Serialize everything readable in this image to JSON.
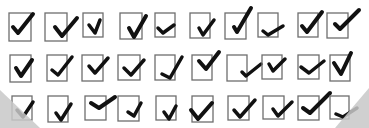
{
  "scene": {
    "description": "Grid of hand-drawn check marks in square boxes",
    "background": "#ffffff",
    "box_color": "#6e6e6e",
    "check_color": "#111111",
    "shadow_color": "#c8c8c8"
  },
  "rows": [
    {
      "y": 13,
      "items": [
        {
          "x": 9,
          "w": 22,
          "h": 28,
          "check": "M13 27 L18 33 L33 14",
          "sw": 4
        },
        {
          "x": 45,
          "w": 22,
          "h": 28,
          "check": "M55 27 L62 36 L77 18",
          "sw": 4
        },
        {
          "x": 83,
          "w": 20,
          "h": 24,
          "check": "M89 25 L95 33 L100 20",
          "sw": 3.5
        },
        {
          "x": 120,
          "w": 22,
          "h": 26,
          "check": "M129 28 L134 37 L146 16",
          "sw": 4
        },
        {
          "x": 155,
          "w": 20,
          "h": 24,
          "check": "M158 28 L163 33 L174 25",
          "sw": 3.5
        },
        {
          "x": 190,
          "w": 20,
          "h": 25,
          "check": "M199 28 L203 35 L214 20",
          "sw": 3.5
        },
        {
          "x": 225,
          "w": 21,
          "h": 26,
          "check": "M234 27 L237 32 L251 8",
          "sw": 4
        },
        {
          "x": 258,
          "w": 20,
          "h": 24,
          "check": "M263 31 L268 35 L283 26",
          "sw": 3.5
        },
        {
          "x": 298,
          "w": 20,
          "h": 24,
          "check": "M302 26 L307 32 L322 12",
          "sw": 4
        },
        {
          "x": 327,
          "w": 21,
          "h": 25,
          "check": "M335 24 L340 29 L359 10",
          "sw": 4
        }
      ]
    },
    {
      "y": 55,
      "items": [
        {
          "x": 10,
          "w": 21,
          "h": 27,
          "check": "M16 68 L21 76 L32 60",
          "sw": 4
        },
        {
          "x": 47,
          "w": 20,
          "h": 26,
          "check": "M52 70 L58 75 L72 57",
          "sw": 3.5
        },
        {
          "x": 82,
          "w": 21,
          "h": 26,
          "check": "M89 66 L95 73 L108 58",
          "sw": 3.5
        },
        {
          "x": 118,
          "w": 22,
          "h": 25,
          "check": "M124 68 L131 75 L144 60",
          "sw": 3.5
        },
        {
          "x": 155,
          "w": 20,
          "h": 25,
          "check": "M162 74 L170 78 L182 57",
          "sw": 3.5
        },
        {
          "x": 192,
          "w": 20,
          "h": 25,
          "check": "M199 61 L206 69 L219 52",
          "sw": 4
        },
        {
          "x": 227,
          "w": 20,
          "h": 26,
          "check": "M242 72 L246 76 L261 64",
          "sw": 3.5
        },
        {
          "x": 262,
          "w": 20,
          "h": 24,
          "check": "M269 64 L273 71 L285 59",
          "sw": 3.5
        },
        {
          "x": 298,
          "w": 21,
          "h": 24,
          "check": "M301 67 L309 73 L324 61",
          "sw": 3.5
        },
        {
          "x": 330,
          "w": 20,
          "h": 26,
          "check": "M334 63 L341 74 L351 53",
          "sw": 4
        }
      ]
    },
    {
      "y": 96,
      "items": [
        {
          "x": 12,
          "w": 20,
          "h": 24,
          "check": "M17 110 L23 117 L33 102",
          "sw": 3.5
        },
        {
          "x": 48,
          "w": 20,
          "h": 26,
          "check": "M56 113 L61 120 L71 104",
          "sw": 3.5
        },
        {
          "x": 85,
          "w": 21,
          "h": 24,
          "check": "M91 103 L99 108 L115 97",
          "sw": 4
        },
        {
          "x": 118,
          "w": 21,
          "h": 25,
          "check": "M128 112 L134 116 L141 103",
          "sw": 3.5
        },
        {
          "x": 156,
          "w": 20,
          "h": 24,
          "check": "M164 112 L169 119 L176 106",
          "sw": 3.5
        },
        {
          "x": 192,
          "w": 21,
          "h": 26,
          "check": "M191 110 L198 119 L212 103",
          "sw": 4
        },
        {
          "x": 228,
          "w": 21,
          "h": 24,
          "check": "M234 110 L240 117 L255 100",
          "sw": 3.5
        },
        {
          "x": 263,
          "w": 21,
          "h": 23,
          "check": "M273 109 L278 116 L292 102",
          "sw": 3.5
        },
        {
          "x": 298,
          "w": 21,
          "h": 24,
          "check": "M303 108 L310 113 L330 93",
          "sw": 4
        },
        {
          "x": 330,
          "w": 19,
          "h": 23,
          "check": "M336 114 L343 117 L357 108",
          "sw": 3.5
        }
      ]
    }
  ]
}
